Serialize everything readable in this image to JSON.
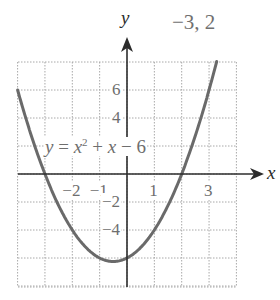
{
  "answer": "−3, 2",
  "equation": {
    "lhs": "y",
    "eq": " = ",
    "x": "x",
    "exp": "2",
    "rest_plus": " + ",
    "x2": "x",
    "rest_minus": " − 6"
  },
  "axes": {
    "x_label": "x",
    "y_label": "y"
  },
  "ticks": {
    "x": [
      {
        "v": -2,
        "label": "−2"
      },
      {
        "v": -1,
        "label": "−1"
      },
      {
        "v": 1,
        "label": "1"
      },
      {
        "v": 3,
        "label": "3"
      }
    ],
    "y": [
      {
        "v": 6,
        "label": "6"
      },
      {
        "v": 4,
        "label": "4"
      },
      {
        "v": -2,
        "label": "−2"
      },
      {
        "v": -4,
        "label": "−4"
      }
    ]
  },
  "colors": {
    "curve": "#6a6a6a",
    "axis": "#2c2c2c",
    "grid": "#a8a8a8",
    "text": "#6e6e6e"
  },
  "chart_data": {
    "type": "line",
    "title": "",
    "function": "y = x^2 + x - 6",
    "xlabel": "x",
    "ylabel": "y",
    "xlim": [
      -4,
      4
    ],
    "ylim": [
      -8,
      8
    ],
    "grid": true,
    "grid_step": {
      "x": 1,
      "y": 2
    },
    "x_ticks_labeled": [
      -2,
      -1,
      1,
      3
    ],
    "y_ticks_labeled": [
      6,
      4,
      -2,
      -4
    ],
    "series": [
      {
        "name": "y = x^2 + x - 6",
        "x": [
          -4,
          -3.5,
          -3,
          -2.5,
          -2,
          -1.5,
          -1,
          -0.5,
          0,
          0.5,
          1,
          1.5,
          2,
          2.5,
          3,
          3.27
        ],
        "y": [
          6,
          2.75,
          0,
          -2.25,
          -4,
          -5.25,
          -6,
          -6.25,
          -6,
          -5.25,
          -4,
          -2.25,
          0,
          2.75,
          6,
          8
        ]
      }
    ],
    "key_points": {
      "x_intercepts": [
        -3,
        2
      ],
      "y_intercept": -6,
      "vertex": [
        -0.5,
        -6.25
      ]
    },
    "annotations": [
      "−3, 2"
    ]
  }
}
